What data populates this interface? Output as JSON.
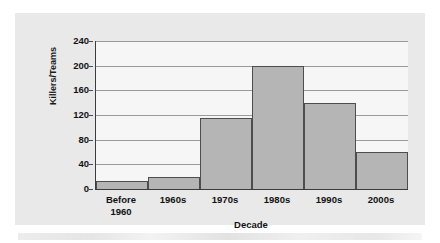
{
  "chart_data": {
    "type": "bar",
    "title": "",
    "xlabel": "Decade",
    "ylabel": "Killers/Teams",
    "categories": [
      "Before\n1960",
      "1960s",
      "1970s",
      "1980s",
      "1990s",
      "2000s"
    ],
    "values": [
      13,
      19,
      115,
      200,
      140,
      60
    ],
    "ylim": [
      0,
      240
    ],
    "yticks": [
      "0",
      "40",
      "80",
      "120",
      "160",
      "200",
      "240"
    ],
    "ytick_values": [
      0,
      40,
      80,
      120,
      160,
      200,
      240
    ],
    "grid": "horizontal",
    "legend": "none",
    "bar_fill_color": "#b5b5b5",
    "bar_border_color": "#4d4d4d",
    "panel_color": "#e9e9e9",
    "plot_background_color": "#f6f6f6",
    "gridline_color": "#9a9a9a",
    "axis_color": "#3c3c3c",
    "text_color": "#111111"
  }
}
